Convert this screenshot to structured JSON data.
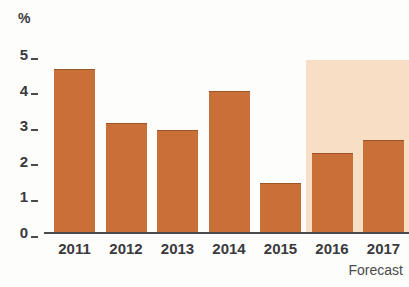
{
  "chart_data": {
    "type": "bar",
    "title": "",
    "subtitle": "",
    "xlabel": "",
    "ylabel": "%",
    "unit_symbol": "%",
    "categories": [
      "2011",
      "2012",
      "2013",
      "2014",
      "2015",
      "2016",
      "2017"
    ],
    "values": [
      4.6,
      3.1,
      2.9,
      4.0,
      1.4,
      2.25,
      2.6
    ],
    "series": [
      {
        "name": "Growth",
        "values": [
          4.6,
          3.1,
          2.9,
          4.0,
          1.4,
          2.25,
          2.6
        ]
      }
    ],
    "ylim": [
      0,
      5
    ],
    "yticks": [
      0,
      1,
      2,
      3,
      4,
      5
    ],
    "ytick_labels": [
      "0",
      "1",
      "2",
      "3",
      "4",
      "5"
    ],
    "grid": false,
    "legend": null,
    "bar_color": "#c87038",
    "forecast_band_color": "#f7dec4",
    "axis_color": "#4a4a4c",
    "text_color": "#3a3a3c",
    "annotations": [
      {
        "name": "forecast-note",
        "text": "Forecast",
        "position": "bottom-right"
      }
    ],
    "forecast": {
      "label": "Forecast",
      "categories": [
        "2016",
        "2017"
      ],
      "band_top_value": 5.0
    }
  },
  "axis": {
    "unit": "%",
    "ticks": [
      {
        "label": "5",
        "value": 5
      },
      {
        "label": "4",
        "value": 4
      },
      {
        "label": "3",
        "value": 3
      },
      {
        "label": "2",
        "value": 2
      },
      {
        "label": "1",
        "value": 1
      },
      {
        "label": "0",
        "value": 0
      }
    ]
  },
  "x_axis": {
    "labels": [
      "2011",
      "2012",
      "2013",
      "2014",
      "2015",
      "2016",
      "2017"
    ]
  },
  "footer": {
    "forecast_label": "Forecast"
  }
}
